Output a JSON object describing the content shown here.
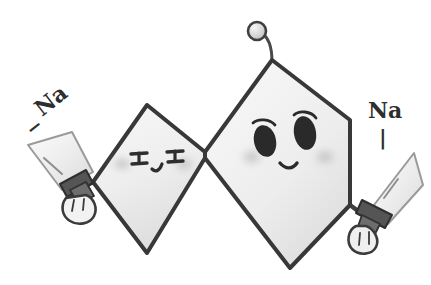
{
  "artwork": {
    "title": "Na character doodle",
    "medium": "pencil sketch",
    "background_color": "#ffffff",
    "ink_color": "#3a3a3a",
    "body_fill": "#f1f1f1",
    "body_shadow": "#d8d8d8",
    "blade_fill": "#efefef",
    "eye_color": "#2b2b2b",
    "blush_color": "#c9c9c9"
  },
  "character": {
    "name": "salt-crystal-character",
    "left_body": {
      "name": "left-rhombus-body",
      "shape": "rhombus",
      "points": "93,182 147,105 205,152 205,158 147,253"
    },
    "right_body": {
      "name": "right-hexagon-body",
      "shape": "hexagon",
      "points": "205,152 272,60 350,120 350,205 290,268 205,158"
    },
    "antenna": {
      "name": "antenna",
      "stalk_path": "M272,62 C272,45 268,38 262,33",
      "ball_cx": 257,
      "ball_cy": 31,
      "ball_r": 9
    },
    "left_face": {
      "name": "left-face-kaomoji",
      "expression": "エ_エ",
      "left_eye_label": "エ",
      "right_eye_label": "エ",
      "mouth_label": "_",
      "blush_left_cx": 122,
      "blush_right_cx": 184,
      "blush_cy": 164
    },
    "right_face": {
      "name": "right-face-kawaii",
      "expression": "smiling",
      "left_eye": {
        "cx": 265,
        "cy": 140,
        "rx": 11,
        "ry": 16,
        "rot": -12
      },
      "right_eye": {
        "cx": 305,
        "cy": 133,
        "rx": 11,
        "ry": 17,
        "rot": -10
      },
      "left_brow_path": "M253,123 C258,118 270,119 275,125",
      "right_brow_path": "M294,115 C299,110 311,111 316,118",
      "mouth_path": "M280,163 C286,170 293,169 297,163",
      "blush_left_cx": 252,
      "blush_right_cx": 325,
      "blush_cy": 157
    }
  },
  "left_sword": {
    "name": "left-sword",
    "label": "Na",
    "tick_mark": "−",
    "label_rotation": -38,
    "blade_points": "28,145 72,132 93,172 62,190",
    "fuller_path": "M44,158 L62,174",
    "guard_points": "60,184 86,170 93,183 67,197",
    "grip_points": "70,190 86,182 94,196 78,204",
    "hand_path": "M66,198 C60,206 62,216 70,221 C78,226 90,224 94,216 C98,208 94,198 86,195 Z"
  },
  "right_sword": {
    "name": "right-sword",
    "label": "Na",
    "tick_mark": "|",
    "label_rotation": 0,
    "blade_points": "414,153 423,185 388,224 374,205",
    "fuller_path": "M398,179 L384,198",
    "guard_points": "362,200 392,215 385,228 356,213",
    "grip_points": "362,215 380,224 373,238 357,229",
    "hand_path": "M356,226 C348,230 346,242 352,249 C359,256 372,255 376,247 C380,239 374,229 366,226 Z"
  },
  "arms": {
    "left_arm_path": "M93,182 L70,194",
    "right_arm_path": "M350,205 L362,214"
  }
}
